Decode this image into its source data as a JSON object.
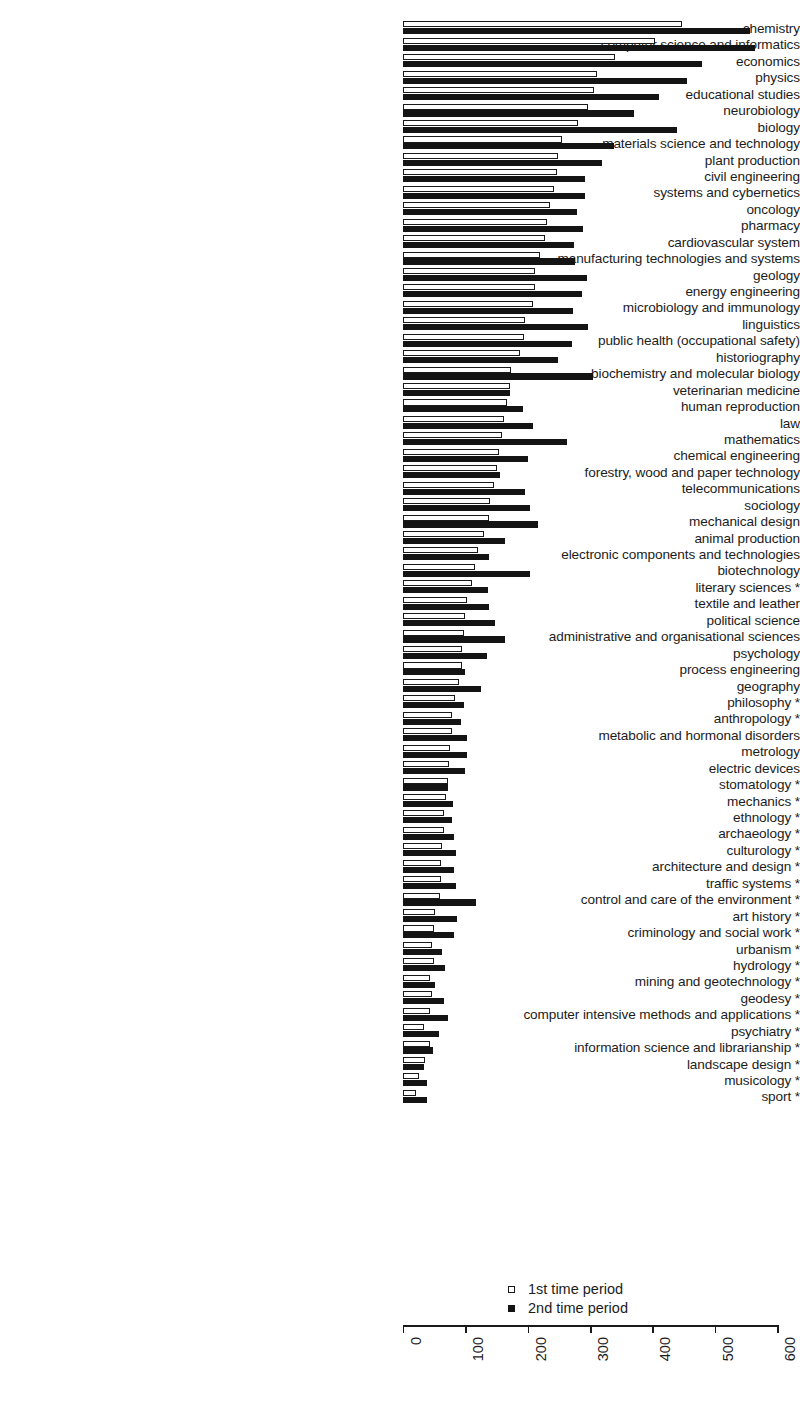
{
  "chart_data": {
    "type": "bar",
    "orientation": "horizontal",
    "title": "",
    "xlabel": "",
    "ylabel": "",
    "xlim": [
      0,
      600
    ],
    "xticks": [
      0,
      100,
      200,
      300,
      400,
      500,
      600
    ],
    "grid": false,
    "legend_position": "bottom-right",
    "legend": [
      "1st time period",
      "2nd time period"
    ],
    "series": [
      {
        "name": "1st time period",
        "style": "open",
        "color": "#ffffff",
        "edge_color": "#1a1a1a",
        "values": [
          447,
          404,
          340,
          311,
          306,
          297,
          281,
          255,
          249,
          246,
          242,
          236,
          231,
          228,
          220,
          212,
          212,
          209,
          196,
          194,
          188,
          173,
          172,
          167,
          161,
          158,
          153,
          150,
          145,
          140,
          137,
          129,
          120,
          116,
          111,
          102,
          100,
          98,
          95,
          95,
          89,
          84,
          79,
          79,
          76,
          73,
          72,
          69,
          65,
          65,
          62,
          61,
          61,
          59,
          52,
          49,
          46,
          49,
          44,
          47,
          44,
          33,
          43,
          36,
          25,
          21
        ]
      },
      {
        "name": "2nd time period",
        "style": "filled",
        "color": "#141414",
        "edge_color": "#141414",
        "values": [
          556,
          564,
          479,
          455,
          410,
          370,
          439,
          338,
          319,
          292,
          292,
          279,
          289,
          274,
          276,
          295,
          287,
          272,
          296,
          271,
          249,
          304,
          172,
          193,
          208,
          262,
          201,
          156,
          196,
          204,
          216,
          164,
          137,
          204,
          136,
          138,
          147,
          164,
          134,
          100,
          125,
          98,
          93,
          102,
          102,
          100,
          72,
          80,
          79,
          81,
          85,
          81,
          85,
          117,
          87,
          81,
          62,
          67,
          52,
          66,
          72,
          57,
          48,
          33,
          38,
          38
        ]
      }
    ],
    "categories": [
      "chemistry",
      "computer science and informatics",
      "economics",
      "physics",
      "educational studies",
      "neurobiology",
      "biology",
      "materials science and technology",
      "plant production",
      "civil engineering",
      "systems and cybernetics",
      "oncology",
      "pharmacy",
      "cardiovascular system",
      "manufacturing technologies and systems",
      "geology",
      "energy engineering",
      "microbiology and immunology",
      "linguistics",
      "public health (occupational safety)",
      "historiography",
      "biochemistry and molecular biology",
      "veterinarian medicine",
      "human reproduction",
      "law",
      "mathematics",
      "chemical engineering",
      "forestry, wood and paper technology",
      "telecommunications",
      "sociology",
      "mechanical design",
      "animal production",
      "electronic components and technologies",
      "biotechnology",
      "literary sciences *",
      "textile and leather",
      "political science",
      "administrative and organisational sciences",
      "psychology",
      "process engineering",
      "geography",
      "philosophy *",
      "anthropology *",
      "metabolic and hormonal disorders",
      "metrology",
      "electric devices",
      "stomatology *",
      "mechanics *",
      "ethnology *",
      "archaeology *",
      "culturology *",
      "architecture and design *",
      "traffic systems *",
      "control and care of the environment *",
      "art history *",
      "criminology and social work *",
      "urbanism *",
      "hydrology *",
      "mining and geotechnology *",
      "geodesy *",
      "computer intensive methods and applications *",
      "psychiatry *",
      "information science and librarianship *",
      "landscape design *",
      "musicology *",
      "sport *"
    ]
  }
}
